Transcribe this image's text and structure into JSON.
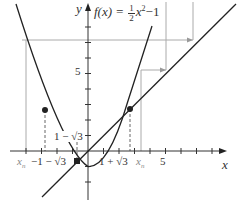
{
  "figure": {
    "function_label": {
      "lhs": "f(x) =",
      "frac_num": "1",
      "frac_den": "2",
      "rhs_var": "x",
      "rhs_exp": "2",
      "rhs_tail": "−1"
    },
    "axes": {
      "x_label": "x",
      "y_label": "y",
      "x_tick_label_5": "5",
      "y_tick_label_5": "5",
      "origin_px": [
        88,
        151
      ],
      "px_per_unit": 15.5
    },
    "annotations": {
      "left_fixed_point_label": "1 − √3",
      "right_fixed_point_label": "1 + √3",
      "neg_root_label": "−1 − √3",
      "xn_left": "x",
      "xn_left_sub": "n",
      "xn_right": "x",
      "xn_right_sub": "n"
    },
    "colors": {
      "curve": "#222222",
      "axis": "#333333",
      "guide": "#aaaaaa",
      "dash": "#666666",
      "marker": "#222222"
    }
  }
}
